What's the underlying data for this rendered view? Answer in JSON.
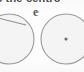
{
  "document": {
    "kind": "scanned-page-fragment",
    "background_color": "#fdfdfd"
  },
  "text": {
    "heading_partial": "s the centro",
    "mid_label": "e"
  },
  "figures": {
    "left_circle": {
      "name": "circle-left",
      "label": "",
      "center_x": 9,
      "center_y": 39,
      "radius": 25,
      "stroke_color": "#9a9a9a",
      "fill_color": "#f4f4f4",
      "clipped_edge": "left",
      "has_center_dot": false,
      "chord_line": {
        "x1": -6,
        "y1": 17,
        "x2": 26,
        "y2": 25,
        "stroke_color": "#8f8f8f"
      }
    },
    "right_circle": {
      "name": "circle-right",
      "label": "",
      "center_x": 66,
      "center_y": 39,
      "radius": 25,
      "stroke_color": "#9a9a9a",
      "fill_color": "#f4f4f4",
      "clipped_edge": "bottom",
      "has_center_dot": true,
      "center_dot": {
        "x": 66,
        "y": 39,
        "radius": 1.6,
        "color": "#6d6d6d"
      }
    }
  },
  "colors": {
    "paper": "#fdfdfd",
    "ink_heading": "#4a4a4a",
    "ink_label": "#5a5a5a",
    "stroke": "#9a9a9a",
    "circle_fill": "#f4f4f4",
    "dot": "#6d6d6d"
  }
}
